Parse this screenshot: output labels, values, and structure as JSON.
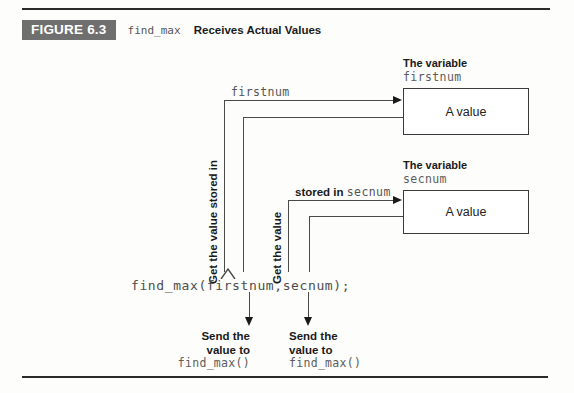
{
  "figure": {
    "number_label": "FIGURE 6.3",
    "caption_code": "find_max",
    "caption_text": "Receives Actual Values",
    "badge_color": "#6f6f6f"
  },
  "variables": [
    {
      "title": "The variable",
      "name": "firstnum",
      "box_value": "A value"
    },
    {
      "title": "The variable",
      "name": "secnum",
      "box_value": "A value"
    }
  ],
  "flow_labels": {
    "firstnum_arrow_label": "firstnum",
    "firstnum_vertical_label": "Get the value stored in",
    "secnum_arrow_label_text": "stored in ",
    "secnum_arrow_label_code": "secnum",
    "secnum_vertical_label": "Get the value"
  },
  "code": {
    "call_statement": "find_max(firstnum,secnum);"
  },
  "send_labels": [
    {
      "line1": "Send the",
      "line2": "value to",
      "code": "find_max()"
    },
    {
      "line1": "Send the",
      "line2": "value to",
      "code": "find_max()"
    }
  ],
  "colors": {
    "rule": "#2b2b2b",
    "connector": "#4a4a4a",
    "box_border": "#3a3a3a",
    "code_text": "#4d4d4d"
  }
}
